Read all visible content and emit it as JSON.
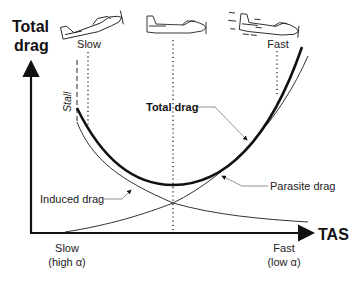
{
  "diagram": {
    "y_axis_label_line1": "Total",
    "y_axis_label_line2": "drag",
    "x_axis_label": "TAS",
    "x_axis_left_line1": "Slow",
    "x_axis_left_line2": "(high α)",
    "x_axis_right_line1": "Fast",
    "x_axis_right_line2": "(low α)",
    "top_label_slow": "Slow",
    "top_label_fast": "Fast",
    "stall_label": "Stall",
    "curves": {
      "total": "Total drag",
      "parasite": "Parasite drag",
      "induced": "Induced drag"
    },
    "airplane_icons": [
      {
        "name": "airplane-slow-icon",
        "attitude": "nose-up, high angle of attack"
      },
      {
        "name": "airplane-level-icon",
        "attitude": "level, minimum drag"
      },
      {
        "name": "airplane-fast-icon",
        "attitude": "nose-down, speed lines"
      }
    ],
    "colors": {
      "line": "#111111",
      "thin_line": "#444444",
      "leader": "#777777",
      "background": "#ffffff"
    }
  }
}
